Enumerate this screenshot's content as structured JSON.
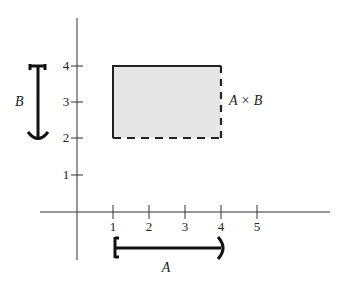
{
  "diagram": {
    "x_axis": {
      "ticks": [
        {
          "value": 1,
          "label": "1"
        },
        {
          "value": 2,
          "label": "2"
        },
        {
          "value": 3,
          "label": "3"
        },
        {
          "value": 4,
          "label": "4"
        },
        {
          "value": 5,
          "label": "5"
        }
      ]
    },
    "y_axis": {
      "ticks": [
        {
          "value": 1,
          "label": "1"
        },
        {
          "value": 2,
          "label": "2"
        },
        {
          "value": 3,
          "label": "3"
        },
        {
          "value": 4,
          "label": "4"
        }
      ]
    },
    "interval_a": {
      "label": "A",
      "from": 1,
      "to": 4,
      "left": "closed",
      "right": "open"
    },
    "interval_b": {
      "label": "B",
      "from": 2,
      "to": 4,
      "bottom": "open",
      "top": "closed"
    },
    "region": {
      "label": "A × B",
      "x_range": [
        1,
        4
      ],
      "y_range": [
        2,
        4
      ],
      "fill": "#e6e6e6",
      "solid_edges": [
        "left",
        "top"
      ],
      "dashed_edges": [
        "right",
        "bottom"
      ]
    },
    "colors": {
      "stroke": "#222222",
      "fill": "#e6e6e6"
    }
  }
}
